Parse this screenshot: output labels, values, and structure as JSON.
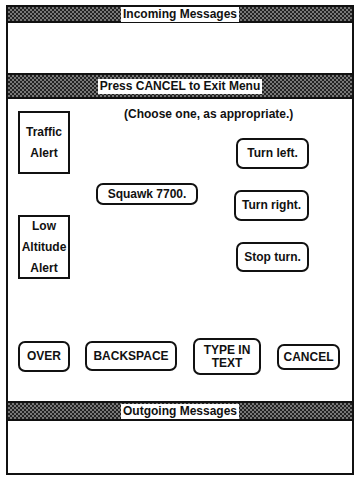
{
  "banners": {
    "incoming": "Incoming Messages",
    "menu": "Press CANCEL to Exit Menu",
    "outgoing": "Outgoing Messages"
  },
  "instruction": "(Choose one, as appropriate.)",
  "alerts": [
    {
      "label": "Traffic Alert",
      "lines": [
        "Traffic",
        "Alert"
      ]
    },
    {
      "label": "Low Altitude Alert",
      "lines": [
        "Low",
        "Altitude",
        "Alert"
      ]
    }
  ],
  "options": {
    "squawk": "Squawk 7700.",
    "turn_left": "Turn left.",
    "turn_right": "Turn right.",
    "stop_turn": "Stop turn."
  },
  "controls": {
    "over": "OVER",
    "backspace": "BACKSPACE",
    "type_in_text_line1": "TYPE IN",
    "type_in_text_line2": "TEXT",
    "cancel": "CANCEL"
  },
  "incoming_messages": [],
  "outgoing_messages": []
}
